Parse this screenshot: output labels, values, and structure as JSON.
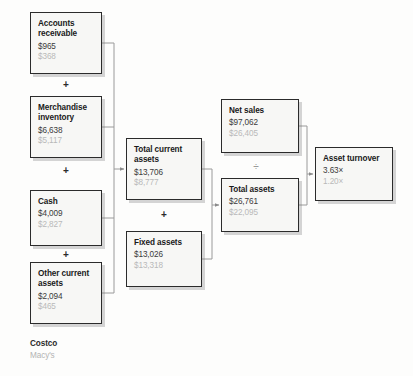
{
  "diagram": {
    "type": "flow-diagram",
    "series": [
      {
        "key": "costco",
        "label": "Costco",
        "color": "#2b2b2b"
      },
      {
        "key": "macys",
        "label": "Macy's",
        "color": "#b3b3b3"
      }
    ],
    "nodes": [
      {
        "id": "accounts-receivable",
        "title_line1": "Accounts",
        "title_line2": "receivable",
        "costco": "$965",
        "macys": "$368"
      },
      {
        "id": "merchandise-inventory",
        "title_line1": "Merchandise",
        "title_line2": "inventory",
        "costco": "$6,638",
        "macys": "$5,117"
      },
      {
        "id": "cash",
        "title_line1": "Cash",
        "title_line2": "",
        "costco": "$4,009",
        "macys": "$2,827"
      },
      {
        "id": "other-current-assets",
        "title_line1": "Other current",
        "title_line2": "assets",
        "costco": "$2,094",
        "macys": "$465"
      },
      {
        "id": "total-current-assets",
        "title_line1": "Total current",
        "title_line2": "assets",
        "costco": "$13,706",
        "macys": "$8,777"
      },
      {
        "id": "fixed-assets",
        "title_line1": "Fixed assets",
        "title_line2": "",
        "costco": "$13,026",
        "macys": "$13,318"
      },
      {
        "id": "net-sales",
        "title_line1": "Net sales",
        "title_line2": "",
        "costco": "$97,062",
        "macys": "$26,405"
      },
      {
        "id": "total-assets",
        "title_line1": "Total assets",
        "title_line2": "",
        "costco": "$26,761",
        "macys": "$22,095"
      },
      {
        "id": "asset-turnover",
        "title_line1": "Asset turnover",
        "title_line2": "",
        "costco": "3.63×",
        "macys": "1.20×"
      }
    ],
    "operators": {
      "plus_1": "+",
      "plus_2": "+",
      "plus_3": "+",
      "plus_4": "+",
      "divide": "÷"
    }
  }
}
